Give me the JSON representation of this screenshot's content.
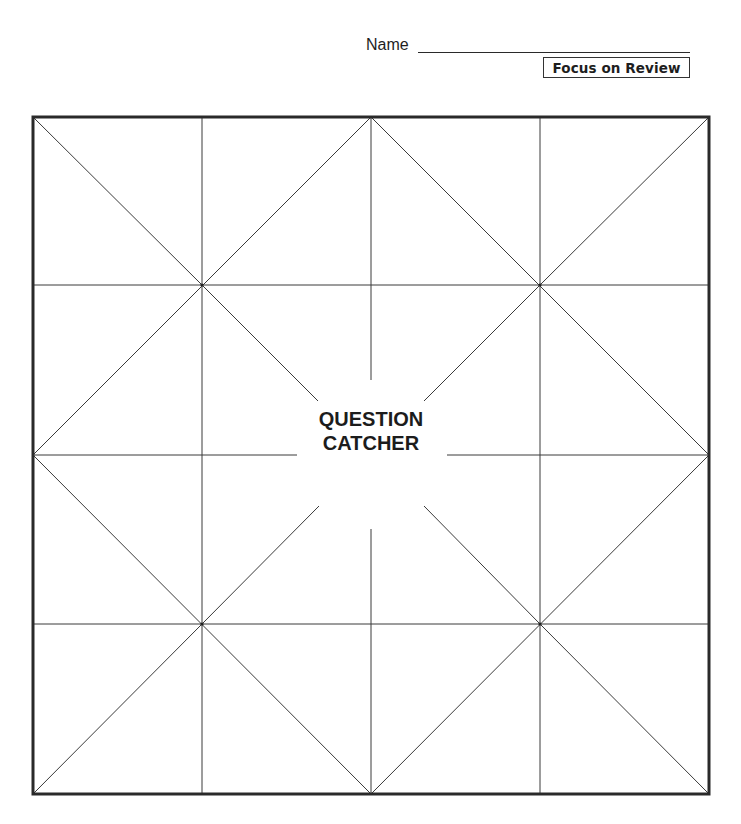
{
  "header": {
    "name_label": "Name",
    "name_value": "",
    "section_badge": "Focus on Review"
  },
  "worksheet": {
    "title_line1": "QUESTION",
    "title_line2": "CATCHER",
    "grid": {
      "rows": 4,
      "columns": 4
    },
    "colors": {
      "line": "#3a3a3a",
      "border": "#2a2a2a",
      "background": "#ffffff"
    }
  }
}
